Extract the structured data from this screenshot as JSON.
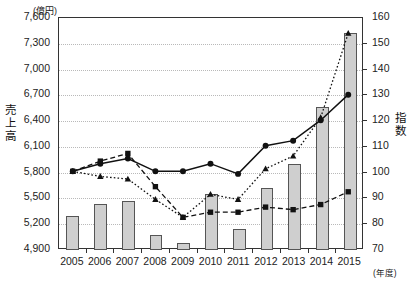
{
  "chart_data": {
    "type": "bar",
    "title": "",
    "subtitle": "",
    "xlabel": "(年度)",
    "ylabel": "売上高",
    "y2label": "指数",
    "left_unit": "(億円)",
    "grid": true,
    "legend_position": "none",
    "categories": [
      "2005",
      "2006",
      "2007",
      "2008",
      "2009",
      "2010",
      "2011",
      "2012",
      "2013",
      "2014",
      "2015"
    ],
    "left_axis": {
      "label": "売上高",
      "unit": "(億円)",
      "ylim": [
        4900,
        7600
      ],
      "step": 300,
      "ticks": [
        "4,900",
        "5,200",
        "5,500",
        "5,800",
        "6,100",
        "6,400",
        "6,700",
        "7,000",
        "7,300",
        "7,600"
      ],
      "tick_values": [
        4900,
        5200,
        5500,
        5800,
        6100,
        6400,
        6700,
        7000,
        7300,
        7600
      ]
    },
    "right_axis": {
      "label": "指数",
      "ylim": [
        70,
        160
      ],
      "step": 10,
      "ticks": [
        "70",
        "80",
        "90",
        "100",
        "110",
        "120",
        "130",
        "140",
        "150",
        "160"
      ],
      "tick_values": [
        70,
        80,
        90,
        100,
        110,
        120,
        130,
        140,
        150,
        160
      ]
    },
    "bars": {
      "name": "売上高",
      "axis": "left",
      "color": "#cfcfcf",
      "edge_color": "#555555",
      "values": [
        5300,
        5430,
        5470,
        5070,
        4980,
        5550,
        5150,
        5620,
        5900,
        6560,
        7420
      ]
    },
    "series": [
      {
        "name": "指数A",
        "axis": "right",
        "marker": "circle",
        "line_style": "solid",
        "color": "#111111",
        "values": [
          100,
          103,
          105,
          100,
          100,
          103,
          99,
          110,
          112,
          120,
          130
        ]
      },
      {
        "name": "指数B",
        "axis": "right",
        "marker": "triangle",
        "line_style": "dotted",
        "color": "#111111",
        "values": [
          100,
          98,
          97,
          89,
          82,
          91,
          89,
          101,
          106,
          121,
          154
        ]
      },
      {
        "name": "指数C",
        "axis": "right",
        "marker": "square",
        "line_style": "dashed",
        "color": "#111111",
        "values": [
          100,
          104,
          107,
          94,
          82,
          84,
          84,
          86,
          85,
          87,
          92
        ]
      }
    ]
  }
}
